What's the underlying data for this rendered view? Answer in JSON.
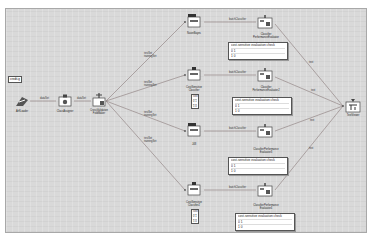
{
  "canvas": {
    "background": "#d9d9d9",
    "edge_color": "#8a7a7a",
    "tag_label": "credit-g"
  },
  "nodes": {
    "loader": {
      "label": "ArffLoader"
    },
    "class_assigner": {
      "label": "ClassAssigner"
    },
    "cv_maker": {
      "label": "CrossValidation\nFoldMaker"
    },
    "naive_bayes": {
      "label": "NaiveBayes"
    },
    "cost_classifier": {
      "label": "CostSensitive\nClassifier"
    },
    "j48": {
      "label": "J48"
    },
    "cost_classifier2": {
      "label": "CostSensitive\nClassifier2"
    },
    "perf_eval1": {
      "label": "Classifier\nPerformanceEvaluator"
    },
    "perf_eval2": {
      "label": "Classifier\nPerformanceEvaluator2"
    },
    "perf_eval3": {
      "label": "ClassifierPerformance\nEvaluator3"
    },
    "perf_eval4": {
      "label": "ClassifierPerformance\nEvaluator4"
    },
    "text_viewer": {
      "label": "TextViewer"
    }
  },
  "edges": {
    "dataset": "dataSet",
    "test_train": "testSet\ntrainingSet",
    "batch": "batchClassifier",
    "text": "text"
  },
  "cost_matrix_panels": {
    "title": "cost-sensitive evaluation check",
    "rows": [
      "0 1",
      "1 0"
    ]
  },
  "cost_matrix_small": {
    "header": "cost",
    "rows": [
      "0 1",
      "5 0"
    ]
  }
}
